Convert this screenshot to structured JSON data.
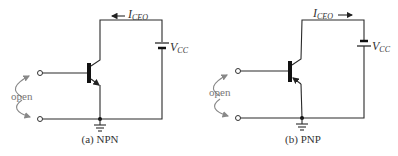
{
  "figure": {
    "panels": [
      {
        "id": "npn",
        "caption": "(a) NPN",
        "current_label": "I",
        "current_sub": "CEO",
        "current_direction": "left",
        "supply_label": "V",
        "supply_sub": "CC",
        "open_label": "open"
      },
      {
        "id": "pnp",
        "caption": "(b) PNP",
        "current_label": "I",
        "current_sub": "CEO",
        "current_direction": "right",
        "supply_label": "V",
        "supply_sub": "CC",
        "open_label": "open"
      }
    ]
  }
}
